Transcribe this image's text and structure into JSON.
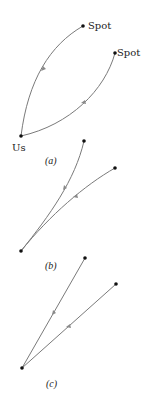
{
  "panels": [
    {
      "id": "a",
      "caption": "(a)",
      "origin_label": "Us",
      "endpoint_labels": [
        "Spot",
        "Spot"
      ],
      "path_style": "strongly curved"
    },
    {
      "id": "b",
      "caption": "(b)",
      "path_style": "slightly curved"
    },
    {
      "id": "c",
      "caption": "(c)",
      "path_style": "straight"
    }
  ],
  "colors": {
    "path": "#7a7a7a",
    "dot": "#111111",
    "text": "#222222"
  }
}
